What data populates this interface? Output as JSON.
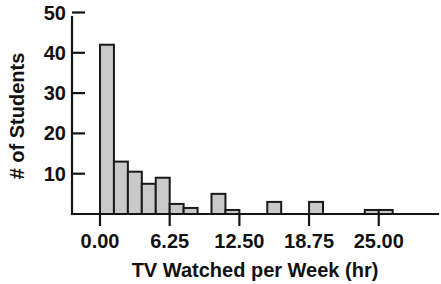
{
  "chart_data": {
    "type": "bar",
    "title": "",
    "subtitle": "",
    "xlabel": "TV Watched per Week (hr)",
    "ylabel": "# of Students",
    "xlim": [
      -1.25,
      30.0
    ],
    "ylim": [
      0,
      50
    ],
    "grid": false,
    "legend": null,
    "bin_width": 1.25,
    "x_tick_labels": [
      "0.00",
      "6.25",
      "12.50",
      "18.75",
      "25.00"
    ],
    "x_tick_values": [
      0.0,
      6.25,
      12.5,
      18.75,
      25.0
    ],
    "y_tick_labels": [
      "10",
      "20",
      "30",
      "40",
      "50"
    ],
    "y_tick_values": [
      10,
      20,
      30,
      40,
      50
    ],
    "bar_fill_color": "#c9c9c9",
    "bar_edge_color": "#1a1a1a",
    "axis_color": "#141414",
    "background_color": "#ffffff",
    "bins": [
      {
        "x0": 0.0,
        "x1": 1.25,
        "value": 42
      },
      {
        "x0": 1.25,
        "x1": 2.5,
        "value": 13
      },
      {
        "x0": 2.5,
        "x1": 3.75,
        "value": 10.5
      },
      {
        "x0": 3.75,
        "x1": 5.0,
        "value": 7.5
      },
      {
        "x0": 5.0,
        "x1": 6.25,
        "value": 9
      },
      {
        "x0": 6.25,
        "x1": 7.5,
        "value": 2.5
      },
      {
        "x0": 7.5,
        "x1": 8.75,
        "value": 1.5
      },
      {
        "x0": 8.75,
        "x1": 10.0,
        "value": 0
      },
      {
        "x0": 10.0,
        "x1": 11.25,
        "value": 5
      },
      {
        "x0": 11.25,
        "x1": 12.5,
        "value": 1
      },
      {
        "x0": 12.5,
        "x1": 13.75,
        "value": 0
      },
      {
        "x0": 13.75,
        "x1": 15.0,
        "value": 0
      },
      {
        "x0": 15.0,
        "x1": 16.25,
        "value": 3
      },
      {
        "x0": 16.25,
        "x1": 17.5,
        "value": 0
      },
      {
        "x0": 17.5,
        "x1": 18.75,
        "value": 0
      },
      {
        "x0": 18.75,
        "x1": 20.0,
        "value": 3
      },
      {
        "x0": 20.0,
        "x1": 21.25,
        "value": 0
      },
      {
        "x0": 21.25,
        "x1": 22.5,
        "value": 0
      },
      {
        "x0": 22.5,
        "x1": 23.75,
        "value": 0
      },
      {
        "x0": 23.75,
        "x1": 25.0,
        "value": 1
      },
      {
        "x0": 25.0,
        "x1": 26.25,
        "value": 1
      }
    ],
    "categories": [
      "0.00-1.25",
      "1.25-2.50",
      "2.50-3.75",
      "3.75-5.00",
      "5.00-6.25",
      "6.25-7.50",
      "7.50-8.75",
      "8.75-10.00",
      "10.00-11.25",
      "11.25-12.50",
      "12.50-13.75",
      "13.75-15.00",
      "15.00-16.25",
      "16.25-17.50",
      "17.50-18.75",
      "18.75-20.00",
      "20.00-21.25",
      "21.25-22.50",
      "22.50-23.75",
      "23.75-25.00",
      "25.00-26.25"
    ],
    "values": [
      42,
      13,
      10.5,
      7.5,
      9,
      2.5,
      1.5,
      0,
      5,
      1,
      0,
      0,
      3,
      0,
      0,
      3,
      0,
      0,
      0,
      1,
      1
    ]
  }
}
